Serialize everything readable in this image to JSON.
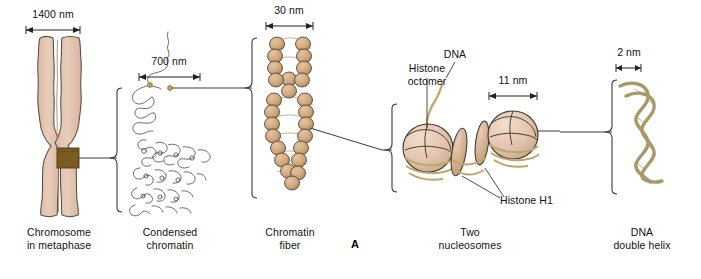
{
  "figure": {
    "panel_letter": "A",
    "background": "#ffffff",
    "width": 701,
    "height": 279
  },
  "colors": {
    "chromosome_fill": "#e2c3b0",
    "chromosome_outline": "#5d5346",
    "centromere_band": "#7a5b20",
    "nucleosome_fill": "#e6c9b6",
    "nucleosome_shade": "#cba88f",
    "nucleosome_outline": "#4a3f33",
    "bead_fill": "#cfa87e",
    "bead_outline": "#4a3a28",
    "dna_strand": "#a89968",
    "line": "#3a3a3a",
    "thread": "#55504a"
  },
  "stages": [
    {
      "id": "chromosome-metaphase",
      "caption": "Chromosome\nin metaphase",
      "scale": "1400 nm"
    },
    {
      "id": "condensed-chromatin",
      "caption": "Condensed\nchromatin",
      "scale": "700 nm"
    },
    {
      "id": "chromatin-fiber",
      "caption": "Chromatin\nfiber",
      "scale": "30 nm"
    },
    {
      "id": "two-nucleosomes",
      "caption": "Two\nnucleosomes",
      "scale": "11 nm"
    },
    {
      "id": "dna-double-helix",
      "caption": "DNA\ndouble helix",
      "scale": "2 nm"
    }
  ],
  "annotations": {
    "dna": "DNA",
    "histone_octomer": "Histone\noctomer",
    "histone_h1": "Histone H1"
  }
}
